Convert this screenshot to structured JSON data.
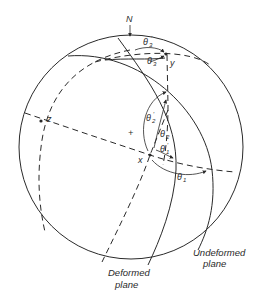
{
  "figure": {
    "type": "stereographic projection",
    "north_label": "N",
    "center_mark": "+",
    "points": {
      "x": "x",
      "y": "y",
      "z": "z"
    },
    "angles": {
      "theta1": "θ",
      "theta1_sub": "1",
      "theta1_prime": "θ",
      "theta1_prime_sub": "1",
      "theta1_prime_mark": "′",
      "theta2": "θ",
      "theta2_sub": "2",
      "theta2_prime": "θ",
      "theta2_prime_sub": "2",
      "theta2_prime_mark": "′",
      "theta3": "θ",
      "theta3_sub": "3",
      "theta3_prime": "θ",
      "theta3_prime_sub": "3",
      "theta3_prime_mark": "′"
    },
    "captions": {
      "deformed_line1": "Deformed",
      "deformed_line2": "plane",
      "undeformed_line1": "Undeformed",
      "undeformed_line2": "plane"
    }
  }
}
